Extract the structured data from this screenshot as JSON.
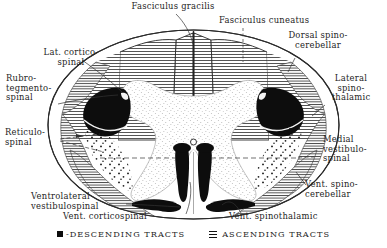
{
  "figure": {
    "background_color": "#ffffff",
    "ink_color": "#1c1c1c",
    "descending_color": "#0d0d0d",
    "ascending_fill": "hatched"
  },
  "labels": {
    "fasciculus_gracilis": "Fasciculus gracilis",
    "fasciculus_cuneatus": "Fasciculus cuneatus",
    "dorsal_spinocerebellar": "Dorsal spino-\ncerebellar",
    "lat_corticospinal": "Lat. cortico-\nspinal",
    "rubro_tegmento_spinal": "Rubro-\ntegmento-\nspinal",
    "lateral_spinothalamic": "Lateral\nspino-\nthalamic",
    "reticulospinal": "Reticulo-\nspinal",
    "medial_vestibulospinal": "Medial\nvestibulo-\nspinal",
    "ventrolateral_vestibulospinal": "Ventrolateral\nvestibulospinal",
    "vent_spinocerebellar": "Vent. spino-\ncerebellar",
    "vent_corticospinal": "Vent. corticospinal",
    "vent_spinothalamic": "Vent. spinothalamic"
  },
  "legend": {
    "descending": "-DESCENDING TRACTS",
    "ascending": "ASCENDING TRACTS",
    "descending_swatch": "solid-black-square-icon",
    "ascending_swatch": "horizontal-hatch-square-icon"
  }
}
